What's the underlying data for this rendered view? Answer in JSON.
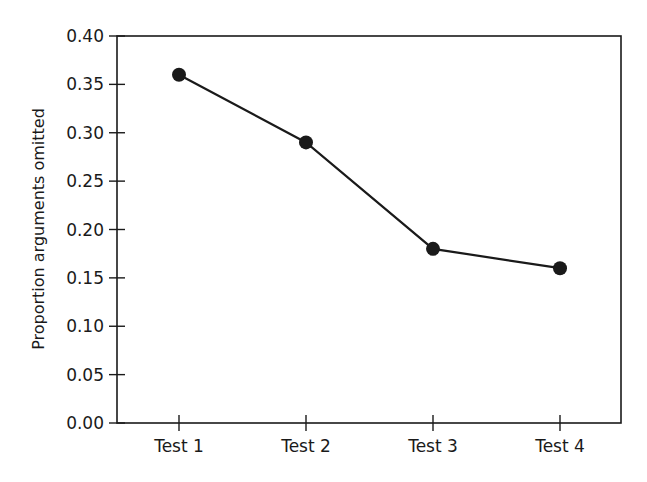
{
  "chart_data": {
    "type": "line",
    "title": "",
    "xlabel": "",
    "ylabel": "Proportion arguments omitted",
    "categories": [
      "Test 1",
      "Test 2",
      "Test 3",
      "Test 4"
    ],
    "values": [
      0.36,
      0.29,
      0.18,
      0.16
    ],
    "ylim": [
      0.0,
      0.4
    ],
    "yticks": [
      "0.00",
      "0.05",
      "0.10",
      "0.15",
      "0.20",
      "0.25",
      "0.30",
      "0.35",
      "0.40"
    ],
    "grid": false,
    "legend": null,
    "marker": "filled-circle",
    "line_color": "#1a1a1a"
  }
}
